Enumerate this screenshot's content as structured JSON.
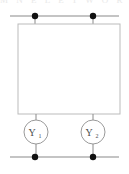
{
  "diagram": {
    "type": "two-port-network-schematic",
    "background_color": "#ffffff",
    "top_strip": {
      "text": "partial-clipped-text-row",
      "color": "#e9e9e9"
    },
    "colors": {
      "wire": "#8a8a8a",
      "block_border": "#bbbbbb",
      "node_fill": "#111111",
      "label_text": "#4a4a4a"
    },
    "block": {
      "name": "network-block",
      "x": 18,
      "y": 24,
      "width": 102,
      "height": 90,
      "fill": "#ffffff",
      "stroke": "#bbbbbb"
    },
    "rails": [
      {
        "name": "top-rail",
        "y": 16,
        "x1": 10,
        "x2": 119
      },
      {
        "name": "bottom-rail",
        "y": 157,
        "x1": 10,
        "x2": 119
      }
    ],
    "nodes": [
      {
        "name": "node-top-left",
        "x": 35,
        "y": 16,
        "r": 3.2
      },
      {
        "name": "node-top-right",
        "x": 93,
        "y": 16,
        "r": 3.2
      },
      {
        "name": "node-bottom-left",
        "x": 35,
        "y": 157,
        "r": 3.2
      },
      {
        "name": "node-bottom-right",
        "x": 93,
        "y": 157,
        "r": 3.2
      }
    ],
    "elements": [
      {
        "name": "admittance-y1",
        "label": "Y",
        "subscript": "1",
        "cx": 36,
        "cy": 132,
        "r": 12
      },
      {
        "name": "admittance-y2",
        "label": "Y",
        "subscript": "2",
        "cx": 93,
        "cy": 132,
        "r": 12
      }
    ],
    "leads": [
      {
        "name": "lead-top-left",
        "x": 35,
        "y1": 16,
        "y2": 24
      },
      {
        "name": "lead-top-right",
        "x": 93,
        "y1": 16,
        "y2": 24
      },
      {
        "name": "lead-block-to-y1",
        "x": 36,
        "y1": 114,
        "y2": 120
      },
      {
        "name": "lead-block-to-y2",
        "x": 93,
        "y1": 114,
        "y2": 120
      },
      {
        "name": "lead-y1-to-bottom",
        "x": 36,
        "y1": 144,
        "y2": 157
      },
      {
        "name": "lead-y2-to-bottom",
        "x": 93,
        "y1": 144,
        "y2": 157
      }
    ]
  }
}
